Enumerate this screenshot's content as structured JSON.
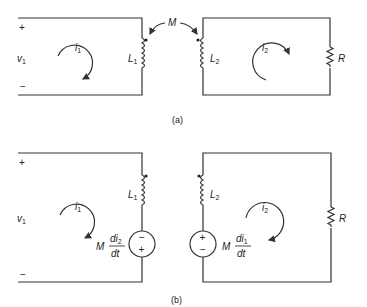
{
  "figure": {
    "part_a": {
      "caption": "(a)",
      "mutual_label": "M",
      "left_loop": {
        "source_label": "v",
        "source_sub": "1",
        "plus": "+",
        "minus": "−",
        "current_label": "i",
        "current_sub": "1",
        "inductor_label": "L",
        "inductor_sub": "1"
      },
      "right_loop": {
        "current_label": "i",
        "current_sub": "2",
        "inductor_label": "L",
        "inductor_sub": "2",
        "resistor_label": "R"
      }
    },
    "part_b": {
      "caption": "(b)",
      "left_loop": {
        "source_label": "v",
        "source_sub": "1",
        "plus": "+",
        "minus": "−",
        "current_label": "i",
        "current_sub": "1",
        "inductor_label": "L",
        "inductor_sub": "1",
        "dep_source": {
          "coef": "M",
          "num": "di",
          "num_sub": "2",
          "den": "dt",
          "top_sign": "−",
          "bottom_sign": "+"
        }
      },
      "right_loop": {
        "current_label": "i",
        "current_sub": "2",
        "inductor_label": "L",
        "inductor_sub": "2",
        "resistor_label": "R",
        "dep_source": {
          "coef": "M",
          "num": "di",
          "num_sub": "1",
          "den": "dt",
          "top_sign": "+",
          "bottom_sign": "−"
        }
      }
    }
  }
}
